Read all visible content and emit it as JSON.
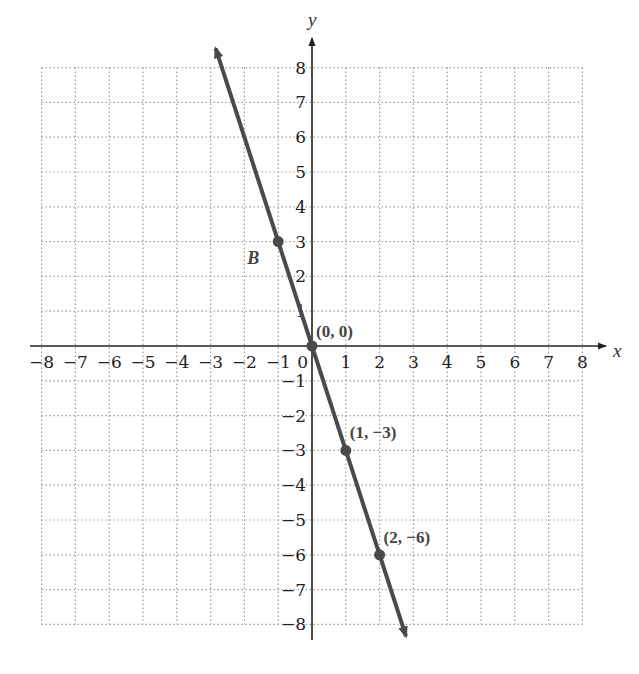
{
  "chart_data": {
    "type": "line",
    "title": "",
    "xlabel": "x",
    "ylabel": "y",
    "xlim": [
      -8,
      8
    ],
    "ylim": [
      -8,
      8
    ],
    "grid": true,
    "grid_style": "dotted",
    "x_ticks": [
      "-8",
      "-7",
      "-6",
      "-5",
      "-4",
      "-3",
      "-2",
      "-1",
      "0",
      "1",
      "2",
      "3",
      "4",
      "5",
      "6",
      "7",
      "8"
    ],
    "y_ticks": [
      "8",
      "7",
      "6",
      "5",
      "4",
      "3",
      "2",
      "1",
      "-1",
      "-2",
      "-3",
      "-4",
      "-5",
      "-6",
      "-7",
      "-8"
    ],
    "series": [
      {
        "name": "y = -3x",
        "equation": "y = -3x",
        "slope": -3,
        "intercept": 0,
        "color": "#4a4a4a",
        "arrows": "both",
        "x_range": [
          -2.85,
          2.78
        ]
      }
    ],
    "points": [
      {
        "label": "B",
        "x": -1,
        "y": 3,
        "label_pos": "lower-left"
      },
      {
        "label": "(0, 0)",
        "x": 0,
        "y": 0,
        "label_pos": "upper-right"
      },
      {
        "label": "(1, −3)",
        "x": 1,
        "y": -3,
        "label_pos": "upper-right"
      },
      {
        "label": "(2, −6)",
        "x": 2,
        "y": -6,
        "label_pos": "upper-right"
      }
    ]
  },
  "colors": {
    "line": "#4a4a4a",
    "axis": "#222222",
    "grid": "#9a9a9a",
    "background": "#ffffff"
  }
}
